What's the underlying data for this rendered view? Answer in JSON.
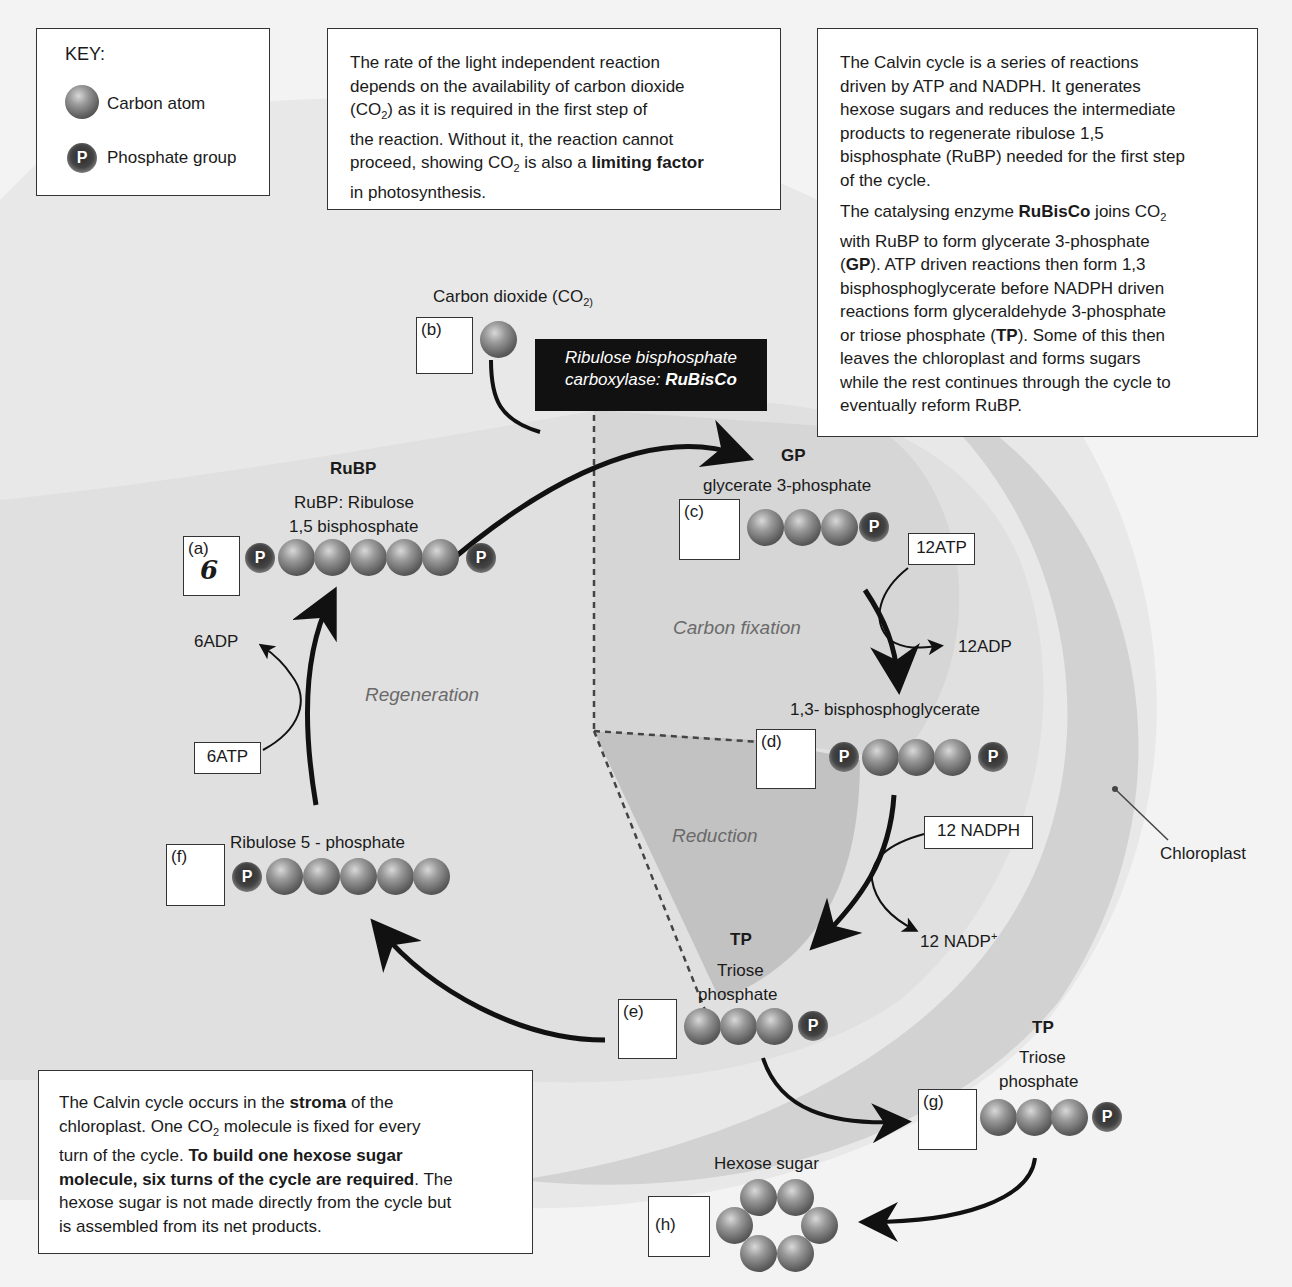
{
  "key": {
    "title": "KEY:",
    "items": [
      {
        "icon": "carbon-atom-icon",
        "label": "Carbon atom"
      },
      {
        "icon": "phosphate-group-icon",
        "label": "Phosphate group",
        "glyph": "P"
      }
    ]
  },
  "info_top_middle": {
    "lines": [
      "The rate of the light independent reaction",
      "depends on the availability of carbon dioxide",
      "(CO2) as it is required in the first step of",
      "the reaction. Without it, the reaction cannot",
      "proceed, showing CO2 is also a limiting factor",
      "in photosynthesis."
    ],
    "bold_terms": [
      "limiting factor"
    ]
  },
  "info_top_right": {
    "para1": [
      "The Calvin cycle is a series of reactions",
      "driven by ATP and NADPH. It generates",
      "hexose sugars and reduces the intermediate",
      "products to regenerate ribulose 1,5",
      "bisphosphate (RuBP) needed for the first step",
      "of the cycle."
    ],
    "para2": [
      "The catalysing enzyme RuBisCo joins CO2",
      "with RuBP to form glycerate 3-phosphate",
      "(GP). ATP driven reactions then form 1,3",
      "bisphosphoglycerate before NADPH driven",
      "reactions form glyceraldehyde 3-phosphate",
      "or triose phosphate (TP). Some of this then",
      "leaves the chloroplast and forms sugars",
      "while the rest continues through the cycle to",
      "eventually reform RuBP."
    ],
    "bold_terms": [
      "RuBisCo",
      "GP",
      "TP"
    ]
  },
  "info_bottom_left": {
    "lines": [
      "The Calvin cycle occurs in the stroma of the",
      "chloroplast. One CO2 molecule is fixed for every",
      "turn of the cycle. To build one hexose sugar",
      "molecule, six turns of the cycle are required. The",
      "hexose sugar is not made directly from the cycle but",
      "is assembled from its net products."
    ],
    "bold_terms": [
      "stroma",
      "To build one hexose sugar molecule, six turns of the cycle are required"
    ]
  },
  "enzyme": {
    "line1": "Ribulose bisphosphate",
    "line2_prefix": "carboxylase: ",
    "line2_bold": "RuBisCo"
  },
  "phases": {
    "carbon_fixation": "Carbon fixation",
    "reduction": "Reduction",
    "regeneration": "Regeneration"
  },
  "molecules": {
    "co2": {
      "title": "Carbon dioxide (CO2)",
      "box_label": "(b)",
      "answer": "",
      "carbons": 1
    },
    "rubp": {
      "abbr": "RuBP",
      "name_line1": "RuBP: Ribulose",
      "name_line2": "1,5 bisphosphate",
      "box_label": "(a)",
      "answer": "6",
      "carbons": 5,
      "phosphates": 2
    },
    "gp": {
      "abbr": "GP",
      "name": "glycerate 3-phosphate",
      "box_label": "(c)",
      "answer": "",
      "carbons": 3,
      "phosphates": 1
    },
    "bpg": {
      "name": "1,3- bisphosphoglycerate",
      "box_label": "(d)",
      "answer": "",
      "carbons": 3,
      "phosphates": 2
    },
    "tp_cycle": {
      "abbr": "TP",
      "name_line1": "Triose",
      "name_line2": "phosphate",
      "box_label": "(e)",
      "answer": "",
      "carbons": 3,
      "phosphates": 1
    },
    "r5p": {
      "name": "Ribulose 5 - phosphate",
      "box_label": "(f)",
      "answer": "",
      "carbons": 5,
      "phosphates": 1
    },
    "tp_out": {
      "abbr": "TP",
      "name_line1": "Triose",
      "name_line2": "phosphate",
      "box_label": "(g)",
      "answer": "",
      "carbons": 3,
      "phosphates": 1
    },
    "hexose": {
      "name": "Hexose sugar",
      "box_label": "(h)",
      "answer": "",
      "carbons": 6
    }
  },
  "cofactors": {
    "atp12": "12ATP",
    "adp12": "12ADP",
    "nadph12": "12 NADPH",
    "nadp12": "12 NADP+",
    "atp6": "6ATP",
    "adp6": "6ADP"
  },
  "chloroplast_label": "Chloroplast",
  "colors": {
    "background": "#f3f3f3",
    "chloroplast_band": "#d4d4d4",
    "stroma": "#e2e2e2",
    "reduction_wedge": "#bdbdbd",
    "enzyme_box": "#111111",
    "phase_text": "#6a6a6a"
  }
}
